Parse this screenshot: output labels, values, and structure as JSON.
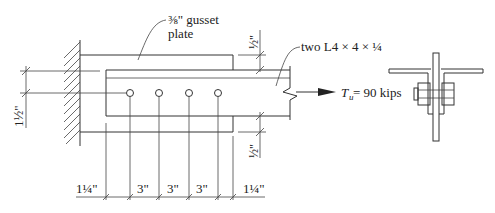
{
  "diagram": {
    "type": "bolted-tension-connection-detail",
    "labels": {
      "gusset": "⅜\" gusset",
      "gusset_line2": "plate",
      "angles": "two L4 × 4 × ¼",
      "load_symbol": "T",
      "load_subscript": "u",
      "load_value": " = 90 kips"
    },
    "dimensions": {
      "vertical_left": "1½\"",
      "vertical_top_right": "½\"",
      "vertical_bottom_right": "½\"",
      "horizontal": [
        "1¼\"",
        "3\"",
        "3\"",
        "3\"",
        "1¼\""
      ]
    },
    "bolts": {
      "count": 4,
      "spacing": "3\""
    },
    "colors": {
      "line": "#333333",
      "text": "#222222",
      "background": "#ffffff"
    }
  }
}
